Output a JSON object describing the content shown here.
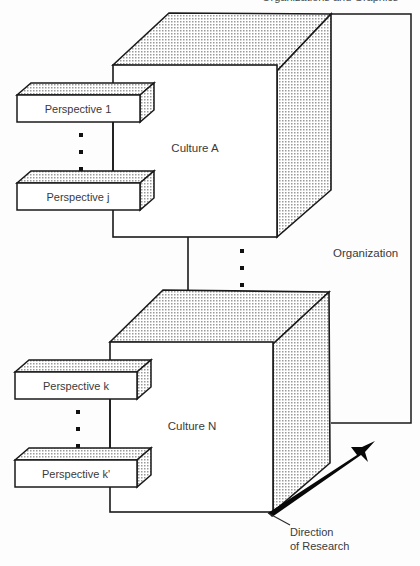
{
  "figure": {
    "type": "isometric-block-diagram",
    "background_color": "#fdfdfd",
    "line_color": "#1a1a1a",
    "shade_fill": "#d9d9d9",
    "text_color": "#3a3a3a"
  },
  "cropped_header": {
    "visible_fragment": "Organizations and Graphics"
  },
  "cubes": [
    {
      "id": "culture-a",
      "label": "Culture A"
    },
    {
      "id": "culture-n",
      "label": "Culture N"
    }
  ],
  "slabs": [
    {
      "id": "perspective-1",
      "label": "Perspective 1"
    },
    {
      "id": "perspective-j",
      "label": "Perspective j"
    },
    {
      "id": "perspective-k",
      "label": "Perspective k"
    },
    {
      "id": "perspective-k-prime",
      "label": "Perspective k'"
    }
  ],
  "annotations": {
    "organization": "Organization",
    "direction_line1": "Direction",
    "direction_line2": "of Research"
  },
  "ellipses": [
    {
      "id": "ellipsis-upper-perspectives",
      "dots": 3,
      "orientation": "vertical"
    },
    {
      "id": "ellipsis-between-cultures",
      "dots": 3,
      "orientation": "vertical"
    },
    {
      "id": "ellipsis-lower-perspectives",
      "dots": 3,
      "orientation": "vertical"
    }
  ]
}
